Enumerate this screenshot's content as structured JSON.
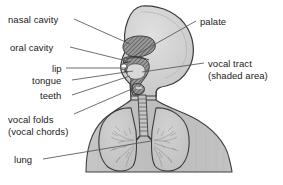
{
  "figure": {
    "colors": {
      "background": "#ffffff",
      "body_fill": "#bdbdbd",
      "head_fill": "#d4d4d4",
      "outline": "#3a3a3a",
      "vocal_tract_shade": "#6f6f6f",
      "lung_fill": "#c9c9c9",
      "lung_detail": "#8a8a8a",
      "leader_line": "#555555",
      "label_text": "#222222"
    }
  },
  "labels": {
    "left": [
      {
        "id": "nasal-cavity",
        "text": "nasal cavity",
        "text2": "",
        "x": 8,
        "y": 14,
        "leader": {
          "x1": 74,
          "y1": 19,
          "x2": 130,
          "y2": 44
        }
      },
      {
        "id": "oral-cavity",
        "text": "oral cavity",
        "text2": "",
        "x": 10,
        "y": 42,
        "leader": {
          "x1": 70,
          "y1": 47,
          "x2": 131,
          "y2": 62
        }
      },
      {
        "id": "lip",
        "text": "lip",
        "text2": "",
        "x": 52,
        "y": 63,
        "leader": {
          "x1": 66,
          "y1": 68,
          "x2": 128,
          "y2": 68
        }
      },
      {
        "id": "tongue",
        "text": "tongue",
        "text2": "",
        "x": 32,
        "y": 75,
        "leader": {
          "x1": 72,
          "y1": 80,
          "x2": 133,
          "y2": 71
        }
      },
      {
        "id": "teeth",
        "text": "teeth",
        "text2": "",
        "x": 40,
        "y": 90,
        "leader": {
          "x1": 72,
          "y1": 95,
          "x2": 130,
          "y2": 76
        }
      },
      {
        "id": "vocal-folds",
        "text": "vocal folds",
        "text2": "(vocal chords)",
        "x": 8,
        "y": 114,
        "leader": {
          "x1": 74,
          "y1": 114,
          "x2": 134,
          "y2": 88
        }
      },
      {
        "id": "lung",
        "text": "lung",
        "text2": "",
        "x": 14,
        "y": 154,
        "leader": {
          "x1": 43,
          "y1": 159,
          "x2": 151,
          "y2": 141
        }
      }
    ],
    "right": [
      {
        "id": "palate",
        "text": "palate",
        "text2": "",
        "x": 200,
        "y": 16,
        "leader": {
          "x1": 196,
          "y1": 21,
          "x2": 134,
          "y2": 56
        }
      },
      {
        "id": "vocal-tract",
        "text": "vocal tract",
        "text2": "(shaded area)",
        "x": 208,
        "y": 58,
        "leader": {
          "x1": 204,
          "y1": 63,
          "x2": 142,
          "y2": 72
        }
      }
    ]
  }
}
